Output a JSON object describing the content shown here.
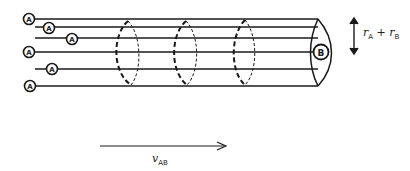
{
  "diagram": {
    "molecule_a_label": "A",
    "molecule_b_label": "B",
    "radius_label": {
      "symbol_a": "r",
      "sub_a": "A",
      "plus": " + ",
      "symbol_b": "r",
      "sub_b": "B"
    },
    "velocity_label": {
      "symbol": "v",
      "sub": "AB"
    },
    "colors": {
      "ink": "#1a1a1a",
      "background": "#ffffff"
    },
    "a_molecules": [
      {
        "x": 29,
        "y": 19
      },
      {
        "x": 49,
        "y": 28
      },
      {
        "x": 72,
        "y": 39
      },
      {
        "x": 29,
        "y": 52
      },
      {
        "x": 52,
        "y": 69
      },
      {
        "x": 30,
        "y": 86
      }
    ],
    "trajectory_lines_y": [
      19,
      27,
      38,
      52,
      69,
      86
    ],
    "cross_sections_x": [
      130,
      185,
      245
    ]
  }
}
